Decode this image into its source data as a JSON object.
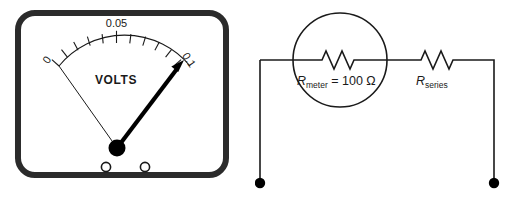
{
  "figure": {
    "background_color": "#ffffff",
    "stroke_color": "#1a1a1a",
    "bezel_color": "#2b2b2b"
  },
  "voltmeter": {
    "name": "analog-voltmeter",
    "brand_label": "VOLTS",
    "scale": {
      "min_label": "0",
      "mid_label": "0.05",
      "max_label": "0.1",
      "min_value": 0,
      "mid_value": 0.05,
      "max_value": 0.1,
      "major_tick_count": 3,
      "minor_ticks_per_half": 4,
      "total_tick_count": 11
    },
    "needle": {
      "reading_label": "0.1",
      "pointing_toward": "max"
    },
    "terminals": [
      {
        "label": "terminal-left"
      },
      {
        "label": "terminal-right"
      }
    ]
  },
  "circuit": {
    "name": "series-resistor-voltmeter-circuit",
    "meter_symbol": "circle",
    "components": [
      {
        "id": "meter-resistor",
        "type": "resistor",
        "label_symbol": "R",
        "label_subscript": "meter",
        "label_equals": " = 100 ",
        "label_unit": "Ω",
        "label_full": "Rmeter = 100 Ω",
        "value": "100",
        "unit": "Ω"
      },
      {
        "id": "series-resistor",
        "type": "resistor",
        "label_symbol": "R",
        "label_subscript": "series",
        "label_equals": "",
        "label_unit": "",
        "label_full": "Rseries",
        "value": "",
        "unit": ""
      }
    ],
    "terminals": [
      {
        "id": "terminal-left",
        "type": "node-dot"
      },
      {
        "id": "terminal-right",
        "type": "node-dot"
      }
    ]
  }
}
